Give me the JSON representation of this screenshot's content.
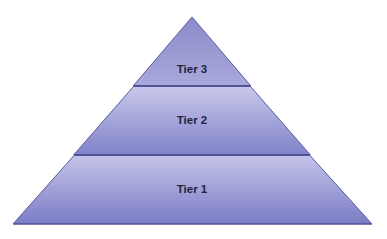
{
  "diagram": {
    "type": "pyramid",
    "colors": {
      "outline": "#55579a",
      "text": "#22243f",
      "tier_top_light": "#c6c6ea",
      "tier_bottom_dark": "#7c7dc6"
    },
    "tiers": [
      {
        "level": 3,
        "label": "Tier 3",
        "position": "top"
      },
      {
        "level": 2,
        "label": "Tier 2",
        "position": "middle"
      },
      {
        "level": 1,
        "label": "Tier 1",
        "position": "bottom"
      }
    ]
  }
}
